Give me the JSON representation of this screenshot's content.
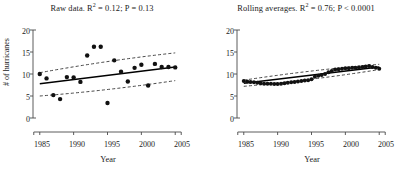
{
  "figure": {
    "axis_color": "#4a4a4a",
    "marker_color": "#111111",
    "fit_line_color": "#000000",
    "ci_line_color": "#333333"
  },
  "panels": [
    {
      "id": "raw-data",
      "title_prefix": "Raw data. R",
      "title_sup": "2",
      "title_suffix": " = 0.12; P = 0.13",
      "ylabel": "# of hurricanes",
      "xlabel": "Year",
      "show_ylabel": true
    },
    {
      "id": "rolling-averages",
      "title_prefix": "Rolling averages. R",
      "title_sup": "2",
      "title_suffix": " = 0.76; P < 0.0001",
      "ylabel": "",
      "xlabel": "Year",
      "show_ylabel": false
    }
  ],
  "chart_data": [
    {
      "type": "scatter",
      "panel": "raw-data",
      "title": "Raw data. R2 = 0.12; P = 0.13",
      "xlabel": "Year",
      "ylabel": "# of hurricanes",
      "xlim": [
        1984,
        2006
      ],
      "ylim": [
        0,
        20
      ],
      "xticks": [
        1985,
        1990,
        1995,
        2000,
        2005
      ],
      "yticks": [
        0,
        5,
        10,
        15,
        20
      ],
      "grid": false,
      "legend": "none",
      "x": [
        1985,
        1986,
        1987,
        1988,
        1989,
        1990,
        1991,
        1992,
        1993,
        1994,
        1995,
        1996,
        1997,
        1998,
        1999,
        2000,
        2001,
        2002,
        2003,
        2004,
        2005
      ],
      "y": [
        10.0,
        9.0,
        5.2,
        4.3,
        9.3,
        9.2,
        8.2,
        14.2,
        16.2,
        16.2,
        3.4,
        13.1,
        10.5,
        8.3,
        11.4,
        12.1,
        7.4,
        12.3,
        11.6,
        11.6,
        11.5
      ],
      "fit_line": {
        "x": [
          1985,
          2005
        ],
        "y_start": 7.8,
        "y_end": 11.6
      },
      "ci_upper": {
        "x": [
          1985,
          2005
        ],
        "y_start": 10.3,
        "y_end": 14.8
      },
      "ci_lower": {
        "x": [
          1985,
          2005
        ],
        "y_start": 5.0,
        "y_end": 8.5
      },
      "r_squared": 0.12,
      "p_value": 0.13
    },
    {
      "type": "scatter",
      "panel": "rolling-averages",
      "title": "Rolling averages. R2 = 0.76; P < 0.0001",
      "xlabel": "Year",
      "ylabel": "# of hurricanes",
      "xlim": [
        1984,
        2006
      ],
      "ylim": [
        0,
        20
      ],
      "xticks": [
        1985,
        1990,
        1995,
        2000,
        2005
      ],
      "yticks": [
        0,
        5,
        10,
        15,
        20
      ],
      "grid": false,
      "legend": "none",
      "x": [
        1985.0,
        1985.5,
        1986.0,
        1986.5,
        1987.0,
        1987.5,
        1988.0,
        1988.5,
        1989.0,
        1989.5,
        1990.0,
        1990.5,
        1991.0,
        1991.5,
        1992.0,
        1992.5,
        1993.0,
        1993.5,
        1994.0,
        1994.5,
        1995.0,
        1995.5,
        1996.0,
        1996.5,
        1997.0,
        1997.5,
        1998.0,
        1998.5,
        1999.0,
        1999.5,
        2000.0,
        2000.5,
        2001.0,
        2001.5,
        2002.0,
        2002.5,
        2003.0,
        2003.5,
        2004.0,
        2004.5,
        2005.0
      ],
      "y": [
        8.4,
        8.3,
        8.2,
        8.1,
        8.0,
        7.9,
        7.8,
        7.8,
        7.8,
        7.7,
        7.7,
        7.8,
        7.9,
        8.0,
        8.1,
        8.2,
        8.3,
        8.4,
        8.5,
        8.6,
        8.8,
        9.4,
        9.6,
        9.8,
        10.0,
        10.4,
        10.7,
        11.0,
        11.1,
        11.2,
        11.3,
        11.3,
        11.4,
        11.4,
        11.5,
        11.6,
        11.7,
        11.8,
        11.6,
        11.4,
        11.2
      ],
      "fit_line": {
        "x": [
          1985,
          2005
        ],
        "y_start": 7.9,
        "y_end": 11.6
      },
      "ci_upper": {
        "x": [
          1985,
          2005
        ],
        "y_start": 8.6,
        "y_end": 12.2
      },
      "ci_lower": {
        "x": [
          1985,
          2005
        ],
        "y_start": 7.2,
        "y_end": 11.0
      },
      "r_squared": 0.76,
      "p_value": 0.0001
    }
  ],
  "axes": {
    "ytick_labels": [
      "20",
      "15",
      "10",
      "5",
      "0"
    ],
    "xtick_labels": [
      "1985",
      "1990",
      "1995",
      "2000",
      "2005"
    ]
  }
}
